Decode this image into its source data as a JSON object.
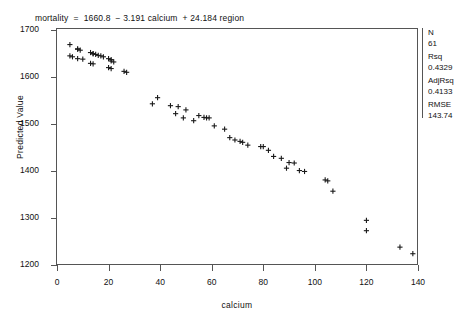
{
  "equation": {
    "text": "mortality  =  1660.8  − 3.191 calcium  + 24.184 region"
  },
  "axes": {
    "x": {
      "label": "calcium",
      "ticks": [
        "0",
        "20",
        "40",
        "60",
        "80",
        "100",
        "120",
        "140"
      ],
      "min": 0,
      "max": 140
    },
    "y": {
      "label": "Predicted Value",
      "ticks": [
        "1700",
        "1600",
        "1500",
        "1400",
        "1300",
        "1200"
      ],
      "min": 1200,
      "max": 1700
    }
  },
  "stats": {
    "n_label": "N",
    "n_value": "61",
    "rsq_label": "Rsq",
    "rsq_value": "0.4329",
    "adjrsq_label": "AdjRsq",
    "adjrsq_value": "0.4133",
    "rmse_label": "RMSE",
    "rmse_value": "143.74"
  },
  "colors": {
    "marker": "#1a1a1a",
    "frame": "#555555",
    "background": "#ffffff"
  },
  "chart_data": {
    "type": "scatter",
    "title": "mortality  =  1660.8  − 3.191 calcium  + 24.184 region",
    "xlabel": "calcium",
    "ylabel": "Predicted Value",
    "xlim": [
      0,
      140
    ],
    "ylim": [
      1200,
      1700
    ],
    "grid": false,
    "legend": null,
    "marker": "plus",
    "n_points": 61,
    "annotations": [
      "N 61",
      "Rsq 0.4329",
      "AdjRsq 0.4133",
      "RMSE 143.74"
    ],
    "points": [
      {
        "x": 5,
        "y": 1669
      },
      {
        "x": 5,
        "y": 1645
      },
      {
        "x": 6,
        "y": 1643
      },
      {
        "x": 8,
        "y": 1660
      },
      {
        "x": 8,
        "y": 1659
      },
      {
        "x": 9,
        "y": 1657
      },
      {
        "x": 8,
        "y": 1639
      },
      {
        "x": 10,
        "y": 1638
      },
      {
        "x": 13,
        "y": 1652
      },
      {
        "x": 14,
        "y": 1650
      },
      {
        "x": 14,
        "y": 1649
      },
      {
        "x": 15,
        "y": 1648
      },
      {
        "x": 16,
        "y": 1646
      },
      {
        "x": 17,
        "y": 1645
      },
      {
        "x": 18,
        "y": 1643
      },
      {
        "x": 13,
        "y": 1629
      },
      {
        "x": 14,
        "y": 1628
      },
      {
        "x": 20,
        "y": 1639
      },
      {
        "x": 21,
        "y": 1637
      },
      {
        "x": 21,
        "y": 1634
      },
      {
        "x": 22,
        "y": 1632
      },
      {
        "x": 20,
        "y": 1620
      },
      {
        "x": 21,
        "y": 1618
      },
      {
        "x": 26,
        "y": 1612
      },
      {
        "x": 27,
        "y": 1610
      },
      {
        "x": 37,
        "y": 1543
      },
      {
        "x": 39,
        "y": 1556
      },
      {
        "x": 44,
        "y": 1539
      },
      {
        "x": 46,
        "y": 1522
      },
      {
        "x": 47,
        "y": 1537
      },
      {
        "x": 50,
        "y": 1530
      },
      {
        "x": 49,
        "y": 1513
      },
      {
        "x": 53,
        "y": 1507
      },
      {
        "x": 55,
        "y": 1518
      },
      {
        "x": 57,
        "y": 1514
      },
      {
        "x": 58,
        "y": 1513
      },
      {
        "x": 59,
        "y": 1513
      },
      {
        "x": 61,
        "y": 1496
      },
      {
        "x": 65,
        "y": 1489
      },
      {
        "x": 67,
        "y": 1471
      },
      {
        "x": 69,
        "y": 1466
      },
      {
        "x": 71,
        "y": 1463
      },
      {
        "x": 72,
        "y": 1461
      },
      {
        "x": 74,
        "y": 1455
      },
      {
        "x": 79,
        "y": 1452
      },
      {
        "x": 80,
        "y": 1452
      },
      {
        "x": 82,
        "y": 1444
      },
      {
        "x": 84,
        "y": 1431
      },
      {
        "x": 87,
        "y": 1427
      },
      {
        "x": 90,
        "y": 1418
      },
      {
        "x": 92,
        "y": 1417
      },
      {
        "x": 89,
        "y": 1406
      },
      {
        "x": 94,
        "y": 1401
      },
      {
        "x": 96,
        "y": 1399
      },
      {
        "x": 104,
        "y": 1381
      },
      {
        "x": 107,
        "y": 1357
      },
      {
        "x": 120,
        "y": 1295
      },
      {
        "x": 120,
        "y": 1273
      },
      {
        "x": 133,
        "y": 1238
      },
      {
        "x": 138,
        "y": 1224
      },
      {
        "x": 105,
        "y": 1379
      }
    ]
  }
}
